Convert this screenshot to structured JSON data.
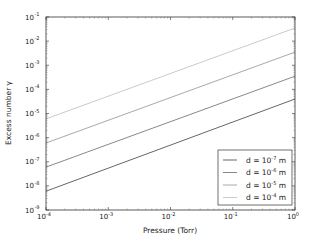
{
  "chart_data": {
    "type": "line",
    "title": "",
    "xlabel": "Pressure (Torr)",
    "ylabel": "Excess number γ",
    "xscale": "log",
    "yscale": "log",
    "xlim": [
      0.0001,
      1
    ],
    "ylim": [
      1e-09,
      0.1
    ],
    "grid": false,
    "legend_position": "lower right",
    "x_ticks": [
      {
        "base": "10",
        "exp": "-4",
        "value": 0.0001
      },
      {
        "base": "10",
        "exp": "-3",
        "value": 0.001
      },
      {
        "base": "10",
        "exp": "-2",
        "value": 0.01
      },
      {
        "base": "10",
        "exp": "-1",
        "value": 0.1
      },
      {
        "base": "10",
        "exp": "0",
        "value": 1
      }
    ],
    "y_ticks": [
      {
        "base": "10",
        "exp": "-1",
        "value": 0.1
      },
      {
        "base": "10",
        "exp": "-2",
        "value": 0.01
      },
      {
        "base": "10",
        "exp": "-3",
        "value": 0.001
      },
      {
        "base": "10",
        "exp": "-4",
        "value": 0.0001
      },
      {
        "base": "10",
        "exp": "-5",
        "value": 1e-05
      },
      {
        "base": "10",
        "exp": "-6",
        "value": 1e-06
      },
      {
        "base": "10",
        "exp": "-7",
        "value": 1e-07
      },
      {
        "base": "10",
        "exp": "-8",
        "value": 1e-08
      },
      {
        "base": "10",
        "exp": "-9",
        "value": 1e-09
      }
    ],
    "x": [
      0.0001,
      1
    ],
    "series": [
      {
        "name": "d = 10^-7 m",
        "label_prefix": "d = 10",
        "label_exp": "-7",
        "label_suffix": " m",
        "color": "#555555",
        "values": [
          6e-09,
          4e-05
        ]
      },
      {
        "name": "d = 10^-6 m",
        "label_prefix": "d = 10",
        "label_exp": "-6",
        "label_suffix": " m",
        "color": "#7a7a7a",
        "values": [
          6e-08,
          0.00035
        ]
      },
      {
        "name": "d = 10^-5 m",
        "label_prefix": "d = 10",
        "label_exp": "-5",
        "label_suffix": " m",
        "color": "#9e9e9e",
        "values": [
          6e-07,
          0.0035
        ]
      },
      {
        "name": "d = 10^-4 m",
        "label_prefix": "d = 10",
        "label_exp": "-4",
        "label_suffix": " m",
        "color": "#c4c4c4",
        "values": [
          6e-06,
          0.035
        ]
      }
    ]
  }
}
